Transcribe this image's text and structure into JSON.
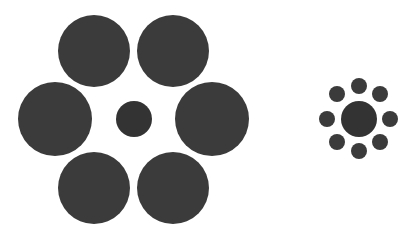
{
  "colors": {
    "background": "#ffffff",
    "circle": "#3b3b3b",
    "center": "#333333"
  },
  "left_figure": {
    "center": {
      "cx": 134,
      "cy": 119,
      "r": 18
    },
    "surround": [
      {
        "cx": 94,
        "cy": 51,
        "r": 36
      },
      {
        "cx": 173,
        "cy": 51,
        "r": 36
      },
      {
        "cx": 55,
        "cy": 119,
        "r": 37
      },
      {
        "cx": 212,
        "cy": 119,
        "r": 37
      },
      {
        "cx": 94,
        "cy": 188,
        "r": 36
      },
      {
        "cx": 173,
        "cy": 188,
        "r": 36
      }
    ]
  },
  "right_figure": {
    "center": {
      "cx": 359,
      "cy": 119,
      "r": 18
    },
    "surround": [
      {
        "cx": 359,
        "cy": 86,
        "r": 8
      },
      {
        "cx": 380,
        "cy": 94,
        "r": 8
      },
      {
        "cx": 390,
        "cy": 119,
        "r": 8
      },
      {
        "cx": 380,
        "cy": 142,
        "r": 8
      },
      {
        "cx": 359,
        "cy": 151,
        "r": 8
      },
      {
        "cx": 337,
        "cy": 142,
        "r": 8
      },
      {
        "cx": 327,
        "cy": 119,
        "r": 8
      },
      {
        "cx": 337,
        "cy": 94,
        "r": 8
      }
    ]
  }
}
